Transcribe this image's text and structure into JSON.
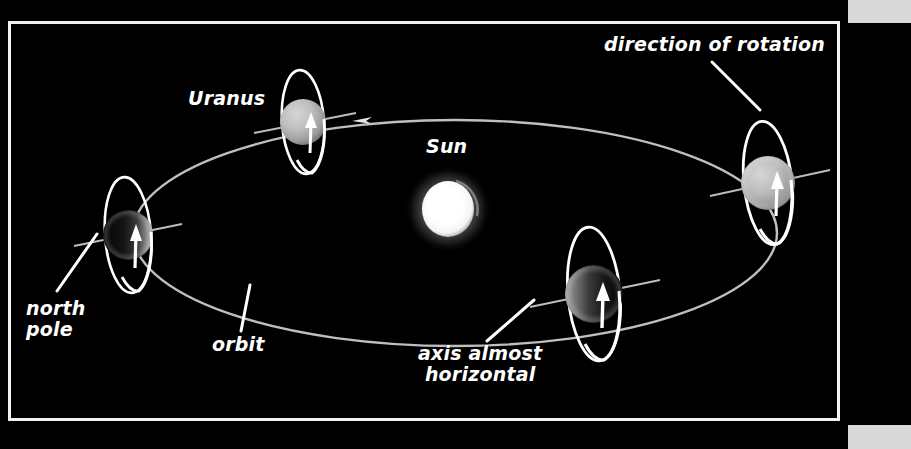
{
  "figure": {
    "background_color": "#000000",
    "frame_color": "#f2f2f2",
    "corner_block_color": "#d8d8d8"
  },
  "labels": {
    "direction_of_rotation": "direction of rotation",
    "uranus": "Uranus",
    "sun": "Sun",
    "north_pole": "north\npole",
    "orbit": "orbit",
    "axis_almost_horizontal": "axis almost\nhorizontal"
  },
  "diagram_data": {
    "type": "diagram",
    "title": "Uranus Orbit and Axial Tilt",
    "orbit": {
      "shape": "ellipse",
      "center": [
        455,
        233
      ],
      "radius_x": 322,
      "radius_y": 113,
      "stroke_color": "#c9c9c9",
      "direction": "counterclockwise",
      "arrow_at": [
        355,
        122
      ]
    },
    "sun": {
      "center": [
        448,
        209
      ],
      "radius": 27,
      "color": "#ffffff",
      "glow": true
    },
    "planets": [
      {
        "name": "uranus-top",
        "position_label": "top",
        "center": [
          303,
          122
        ],
        "radius": 23,
        "lit_side": "full-front",
        "disc_color": "#b9b9b9",
        "ring_rx": 21,
        "ring_ry": 52,
        "ring_tilt_deg": -4,
        "axis_tilt_deg": -6,
        "rotation_arrow": "up"
      },
      {
        "name": "uranus-right",
        "position_label": "right",
        "center": [
          768,
          183
        ],
        "radius": 27,
        "lit_side": "full-front",
        "disc_color": "#c2c2c2",
        "ring_rx": 24,
        "ring_ry": 62,
        "ring_tilt_deg": -6,
        "axis_tilt_deg": -9,
        "rotation_arrow": "up"
      },
      {
        "name": "uranus-bottom",
        "position_label": "bottom",
        "center": [
          594,
          294
        ],
        "radius": 29,
        "lit_side": "left-crescent",
        "disc_color": "#3a3a3a",
        "ring_rx": 26,
        "ring_ry": 67,
        "ring_tilt_deg": -5,
        "axis_tilt_deg": -7,
        "rotation_arrow": "up"
      },
      {
        "name": "uranus-left",
        "position_label": "left",
        "center": [
          128,
          235
        ],
        "radius": 25,
        "lit_side": "right-crescent",
        "disc_color": "#2e2e2e",
        "ring_rx": 23,
        "ring_ry": 58,
        "ring_tilt_deg": -4,
        "axis_tilt_deg": -6,
        "rotation_arrow": "up"
      }
    ],
    "leader_lines": [
      {
        "for": "direction-of-rotation",
        "from": [
          712,
          62
        ],
        "to": [
          768,
          113
        ]
      },
      {
        "for": "north-pole",
        "from": [
          56,
          290
        ],
        "to": [
          98,
          232
        ]
      },
      {
        "for": "orbit",
        "from": [
          240,
          330
        ],
        "to": [
          249,
          284
        ]
      },
      {
        "for": "axis-almost-horizontal",
        "from": [
          486,
          340
        ],
        "to": [
          537,
          298
        ]
      }
    ],
    "notes": [
      "Uranus rotates with its axis almost horizontal to the plane of its orbit",
      "The white vertical ellipse around each planet shows the direction of rotation",
      "The north pole points nearly along the orbital plane"
    ]
  }
}
